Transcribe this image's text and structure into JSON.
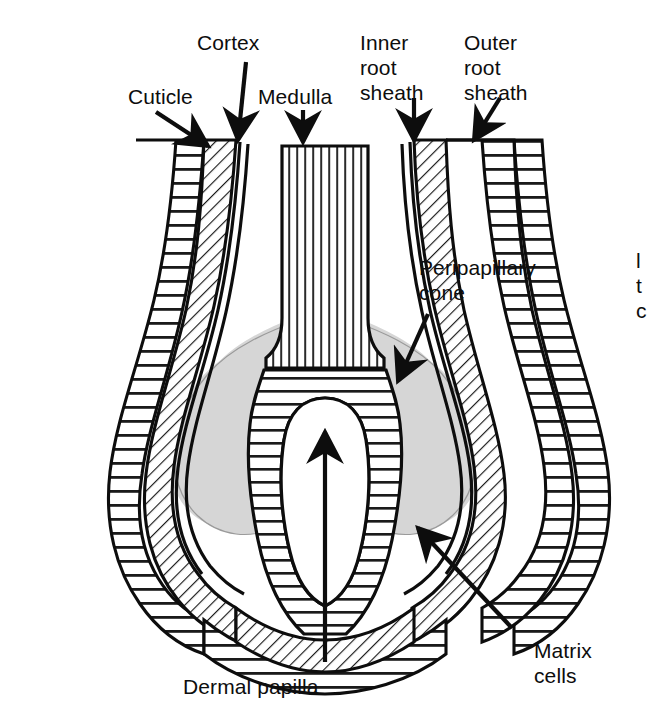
{
  "figure": {
    "type": "anatomical-diagram",
    "background_color": "#ffffff",
    "ink_color": "#0d0d0d",
    "cone_fill_color": "#d6d6d6"
  },
  "labels": {
    "cuticle": "Cuticle",
    "cortex": "Cortex",
    "medulla": "Medulla",
    "inner_root_sheath": "Inner\nroot\nsheath",
    "outer_root_sheath": "Outer\nroot\nsheath",
    "peripapillary_cone": "Peripapillary\ncone",
    "matrix_cells": "Matrix\ncells",
    "dermal_papilla": "Dermal papilla",
    "cut_off_right_margin": "l\nt\nc"
  }
}
